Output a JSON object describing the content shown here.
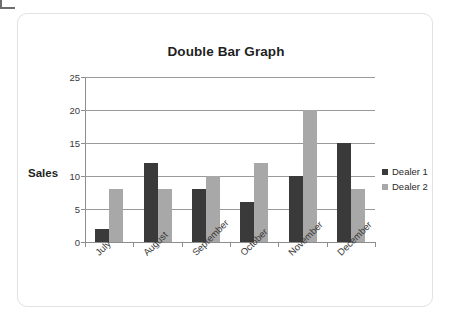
{
  "card": {
    "title": "Double Bar Graph",
    "y_axis_title": "Sales"
  },
  "colors": {
    "series_1": "#3a3a3a",
    "series_2": "#a8a8a8",
    "gridline": "#9a9a9a",
    "axis": "#8d8d8d",
    "card_border": "#e2e2e2",
    "text": "#1f1f1f"
  },
  "legend": {
    "position": "right",
    "items": [
      {
        "label": "Dealer 1",
        "color": "#3a3a3a"
      },
      {
        "label": "Dealer 2",
        "color": "#a8a8a8"
      }
    ]
  },
  "chart_data": {
    "type": "bar",
    "title": "Double Bar Graph",
    "xlabel": "",
    "ylabel": "Sales",
    "ylim": [
      0,
      25
    ],
    "yticks": [
      0,
      5,
      10,
      15,
      20,
      25
    ],
    "ytick_labels": [
      "0",
      "5",
      "10",
      "15",
      "20",
      "25"
    ],
    "grid": true,
    "grid_axis": "y",
    "legend_position": "right",
    "categories": [
      "July",
      "August",
      "September",
      "October",
      "November",
      "December"
    ],
    "series": [
      {
        "name": "Dealer 1",
        "color": "#3a3a3a",
        "values": [
          2,
          12,
          8,
          6,
          10,
          15
        ]
      },
      {
        "name": "Dealer 2",
        "color": "#a8a8a8",
        "values": [
          8,
          8,
          10,
          12,
          20,
          8
        ]
      }
    ]
  }
}
